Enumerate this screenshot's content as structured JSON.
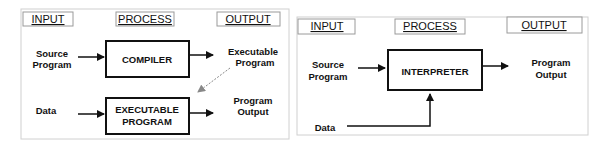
{
  "compiler_diagram": {
    "headers": {
      "input": "INPUT",
      "process": "PROCESS",
      "output": "OUTPUT"
    },
    "source_program": [
      "Source",
      "Program"
    ],
    "compiler_box": "COMPILER",
    "executable_program_out": [
      "Executable",
      "Program"
    ],
    "data": "Data",
    "executable_box": [
      "EXECUTABLE",
      "PROGRAM"
    ],
    "program_output": [
      "Program",
      "Output"
    ]
  },
  "interpreter_diagram": {
    "headers": {
      "input": "INPUT",
      "process": "PROCESS",
      "output": "OUTPUT"
    },
    "source_program": [
      "Source",
      "Program"
    ],
    "interpreter_box": "INTERPRETER",
    "program_output": [
      "Program",
      "Output"
    ],
    "data": "Data"
  },
  "colors": {
    "line": "#111111",
    "panel_border": "#c8c8c8",
    "header_border": "#9a9a9a",
    "dashed_arrow": "#888888"
  }
}
